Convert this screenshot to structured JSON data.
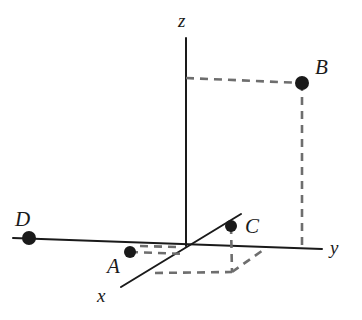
{
  "figure": {
    "type": "3d-coordinate-diagram",
    "width": 362,
    "height": 320,
    "background_color": "#ffffff",
    "stroke_color": "#1a1a1a",
    "dash_color": "#6e6e6e"
  },
  "axes": [
    {
      "name": "z-axis",
      "label": "z",
      "label_x": 178,
      "label_y": 11,
      "x1": 186,
      "y1": 38,
      "x2": 186,
      "y2": 246,
      "orientation": "vertical"
    },
    {
      "name": "y-axis",
      "label": "y",
      "label_x": 330,
      "label_y": 238,
      "x1": 13,
      "y1": 238,
      "x2": 322,
      "y2": 249,
      "orientation": "horizontal-receding"
    },
    {
      "name": "x-axis",
      "label": "x",
      "label_x": 97,
      "label_y": 286,
      "x1": 241,
      "y1": 214,
      "x2": 121,
      "y2": 287,
      "orientation": "oblique-toward-viewer"
    }
  ],
  "origin": {
    "x": 186,
    "y": 244
  },
  "points": [
    {
      "id": "A",
      "label": "A",
      "dot_x": 130,
      "dot_y": 252,
      "dot_radius": 6,
      "label_x": 107,
      "label_y": 256
    },
    {
      "id": "B",
      "label": "B",
      "dot_x": 302,
      "dot_y": 83,
      "dot_radius": 7,
      "label_x": 315,
      "label_y": 57
    },
    {
      "id": "C",
      "label": "C",
      "dot_x": 231,
      "dot_y": 226,
      "dot_radius": 6,
      "label_x": 245,
      "label_y": 216
    },
    {
      "id": "D",
      "label": "D",
      "dot_x": 29,
      "dot_y": 238,
      "dot_radius": 7,
      "label_x": 15,
      "label_y": 209
    }
  ],
  "dashed_lines": [
    {
      "name": "b-horizontal-to-z-axis",
      "x1": 186,
      "y1": 78,
      "x2": 302,
      "y2": 83
    },
    {
      "name": "b-vertical-to-y-axis",
      "x1": 302,
      "y1": 83,
      "x2": 302,
      "y2": 246
    },
    {
      "name": "c-vertical-drop",
      "x1": 231,
      "y1": 226,
      "x2": 232,
      "y2": 272
    },
    {
      "name": "a-horizontal-edge",
      "x1": 130,
      "y1": 252,
      "x2": 185,
      "y2": 254
    },
    {
      "name": "parallelogram-top-edge",
      "x1": 140,
      "y1": 246,
      "x2": 178,
      "y2": 247
    },
    {
      "name": "parallelogram-front-edge",
      "x1": 155,
      "y1": 273,
      "x2": 232,
      "y2": 272
    },
    {
      "name": "parallelogram-right-edge",
      "x1": 232,
      "y1": 272,
      "x2": 266,
      "y2": 248
    }
  ]
}
